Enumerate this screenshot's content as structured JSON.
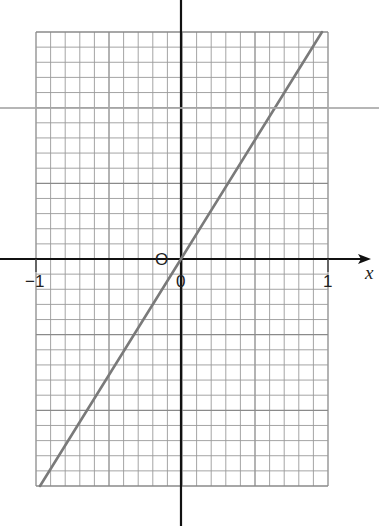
{
  "chart_data": {
    "type": "line",
    "title": "",
    "xlabel": "x",
    "ylabel": "",
    "xlim": [
      -1,
      1
    ],
    "ylim": [
      -1.5,
      1.5
    ],
    "grid": true,
    "grid_minor_step_x": 0.1,
    "grid_minor_step_y": 0.1,
    "grid_major_every": 5,
    "tick_labels": {
      "x": [
        {
          "value": -1,
          "label": "−1"
        },
        {
          "value": 0,
          "label": "0"
        },
        {
          "value": 1,
          "label": "1"
        }
      ],
      "origin_label": "O"
    },
    "series": [
      {
        "name": "line",
        "x": [
          -0.966,
          0,
          0.966
        ],
        "y": [
          -1.5,
          0,
          1.5
        ],
        "color": "#7a7a7a"
      }
    ],
    "legend": null
  },
  "labels": {
    "x_axis": "x",
    "origin": "O",
    "zero": "0",
    "minus_one": "−1",
    "one": "1"
  },
  "colors": {
    "grid": "#9a9a9a",
    "grid_major": "#8a8a8a",
    "axis": "#111111",
    "line": "#7a7a7a",
    "scan_line": "#a9a9a9"
  }
}
